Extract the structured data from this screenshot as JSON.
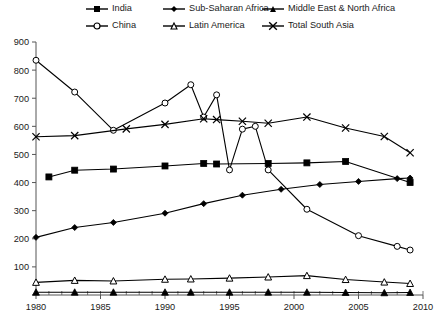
{
  "chart_data": {
    "type": "line",
    "title": "",
    "subtitle": "",
    "xlabel": "",
    "ylabel": "",
    "xlim": [
      1980,
      2010
    ],
    "ylim": [
      0,
      900
    ],
    "ytick_step": 100,
    "yticks": [
      0,
      100,
      200,
      300,
      400,
      500,
      600,
      700,
      800,
      900
    ],
    "ytick_labels": [
      "",
      "100",
      "200",
      "300",
      "400",
      "500",
      "600",
      "700",
      "800",
      "900"
    ],
    "xticks": [
      1980,
      1985,
      1990,
      1995,
      2000,
      2005,
      2010
    ],
    "xtick_labels": [
      "1980",
      "1985",
      "1990",
      "1995",
      "2000",
      "2005",
      "2010"
    ],
    "x_minor_tick_step": 1,
    "grid": false,
    "legend_position": "top",
    "series": [
      {
        "name": "India",
        "marker": "filled-square",
        "color": "#000000",
        "points": [
          [
            1981,
            420
          ],
          [
            1983,
            444
          ],
          [
            1986,
            448
          ],
          [
            1990,
            459
          ],
          [
            1993,
            468
          ],
          [
            1994,
            466
          ],
          [
            1998,
            468
          ],
          [
            2001,
            470
          ],
          [
            2004,
            475
          ],
          [
            2009,
            400
          ]
        ]
      },
      {
        "name": "Sub-Saharan Africa",
        "marker": "filled-diamond",
        "color": "#000000",
        "points": [
          [
            1980,
            205
          ],
          [
            1983,
            240
          ],
          [
            1986,
            258
          ],
          [
            1990,
            291
          ],
          [
            1993,
            325
          ],
          [
            1996,
            355
          ],
          [
            1999,
            376
          ],
          [
            2002,
            393
          ],
          [
            2005,
            404
          ],
          [
            2008,
            414
          ],
          [
            2009,
            416
          ]
        ]
      },
      {
        "name": "Middle East & North Africa",
        "marker": "filled-triangle",
        "color": "#000000",
        "points": [
          [
            1980,
            10
          ],
          [
            1983,
            10
          ],
          [
            1986,
            10
          ],
          [
            1990,
            10
          ],
          [
            1992,
            10
          ],
          [
            1995,
            10
          ],
          [
            1998,
            10
          ],
          [
            2001,
            10
          ],
          [
            2004,
            9
          ],
          [
            2007,
            8
          ],
          [
            2009,
            9
          ]
        ]
      },
      {
        "name": "China",
        "marker": "open-circle",
        "color": "#000000",
        "points": [
          [
            1980,
            835
          ],
          [
            1983,
            722
          ],
          [
            1986,
            586
          ],
          [
            1990,
            683
          ],
          [
            1992,
            748
          ],
          [
            1993,
            633
          ],
          [
            1994,
            712
          ],
          [
            1995,
            445
          ],
          [
            1996,
            590
          ],
          [
            1997,
            600
          ],
          [
            1998,
            445
          ],
          [
            2001,
            305
          ],
          [
            2005,
            211
          ],
          [
            2008,
            173
          ],
          [
            2009,
            160
          ]
        ]
      },
      {
        "name": "Latin America",
        "marker": "open-triangle",
        "color": "#000000",
        "points": [
          [
            1980,
            45
          ],
          [
            1983,
            52
          ],
          [
            1986,
            50
          ],
          [
            1990,
            56
          ],
          [
            1992,
            57
          ],
          [
            1995,
            60
          ],
          [
            1998,
            64
          ],
          [
            2001,
            69
          ],
          [
            2004,
            55
          ],
          [
            2007,
            46
          ],
          [
            2009,
            41
          ]
        ]
      },
      {
        "name": "Total South Asia",
        "marker": "cross-x",
        "color": "#000000",
        "points": [
          [
            1980,
            563
          ],
          [
            1983,
            567
          ],
          [
            1987,
            591
          ],
          [
            1990,
            607
          ],
          [
            1993,
            627
          ],
          [
            1994,
            624
          ],
          [
            1996,
            618
          ],
          [
            1998,
            611
          ],
          [
            2001,
            633
          ],
          [
            2004,
            594
          ],
          [
            2007,
            564
          ],
          [
            2009,
            506
          ]
        ]
      }
    ],
    "legend_entries": [
      {
        "label": "India",
        "marker": "filled-square"
      },
      {
        "label": "Sub-Saharan Africa",
        "marker": "filled-diamond"
      },
      {
        "label": "Middle East & North Africa",
        "marker": "filled-triangle"
      },
      {
        "label": "China",
        "marker": "open-circle"
      },
      {
        "label": "Latin America",
        "marker": "open-triangle"
      },
      {
        "label": "Total South Asia",
        "marker": "cross-x"
      }
    ]
  }
}
